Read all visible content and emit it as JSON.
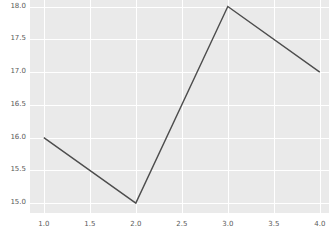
{
  "chart_data": {
    "type": "line",
    "title": "",
    "xlabel": "",
    "ylabel": "",
    "x": [
      1.0,
      2.0,
      3.0,
      4.0
    ],
    "values": [
      16.0,
      15.0,
      18.0,
      17.0
    ],
    "series": [
      {
        "name": "series-1",
        "values": [
          16.0,
          15.0,
          18.0,
          17.0
        ]
      }
    ],
    "xlim": [
      0.85,
      4.1
    ],
    "ylim": [
      14.85,
      18.1
    ],
    "xticks": [
      1.0,
      1.5,
      2.0,
      2.5,
      3.0,
      3.5,
      4.0
    ],
    "yticks": [
      15.0,
      15.5,
      16.0,
      16.5,
      17.0,
      17.5,
      18.0
    ],
    "xticklabels": [
      "1.0",
      "1.5",
      "2.0",
      "2.5",
      "3.0",
      "3.5",
      "4.0"
    ],
    "yticklabels": [
      "15.0",
      "15.5",
      "16.0",
      "16.5",
      "17.0",
      "17.5",
      "18.0"
    ],
    "grid": true,
    "legend": false,
    "legend_position": "none",
    "style": "darkgrid",
    "colors": {
      "line": "#4d4d4d",
      "plot_background": "#eaeaea",
      "figure_background": "#ffffff",
      "gridline": "#ffffff",
      "tick_label": "#5a5a5a"
    },
    "line_width": 1.4,
    "marker": "none"
  }
}
